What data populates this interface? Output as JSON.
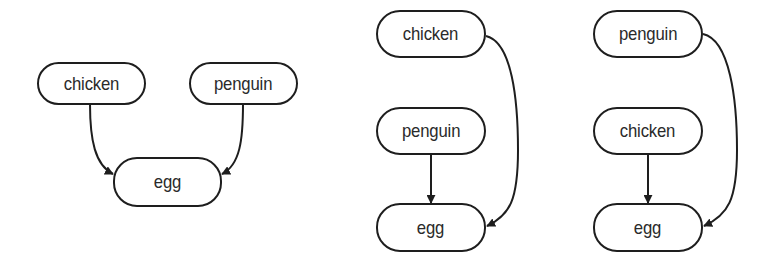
{
  "diagrams": [
    {
      "id": "left",
      "nodes": [
        {
          "key": "chicken",
          "label": "chicken"
        },
        {
          "key": "penguin",
          "label": "penguin"
        },
        {
          "key": "egg",
          "label": "egg"
        }
      ],
      "edges": [
        {
          "from": "chicken",
          "to": "egg"
        },
        {
          "from": "penguin",
          "to": "egg"
        }
      ]
    },
    {
      "id": "middle",
      "nodes": [
        {
          "key": "chicken",
          "label": "chicken"
        },
        {
          "key": "penguin",
          "label": "penguin"
        },
        {
          "key": "egg",
          "label": "egg"
        }
      ],
      "edges": [
        {
          "from": "chicken",
          "to": "egg"
        },
        {
          "from": "penguin",
          "to": "egg"
        }
      ]
    },
    {
      "id": "right",
      "nodes": [
        {
          "key": "penguin",
          "label": "penguin"
        },
        {
          "key": "chicken",
          "label": "chicken"
        },
        {
          "key": "egg",
          "label": "egg"
        }
      ],
      "edges": [
        {
          "from": "penguin",
          "to": "egg"
        },
        {
          "from": "chicken",
          "to": "egg"
        }
      ]
    }
  ],
  "colors": {
    "stroke": "#1e1e1e",
    "text": "#2a2a2a",
    "background": "#ffffff"
  }
}
